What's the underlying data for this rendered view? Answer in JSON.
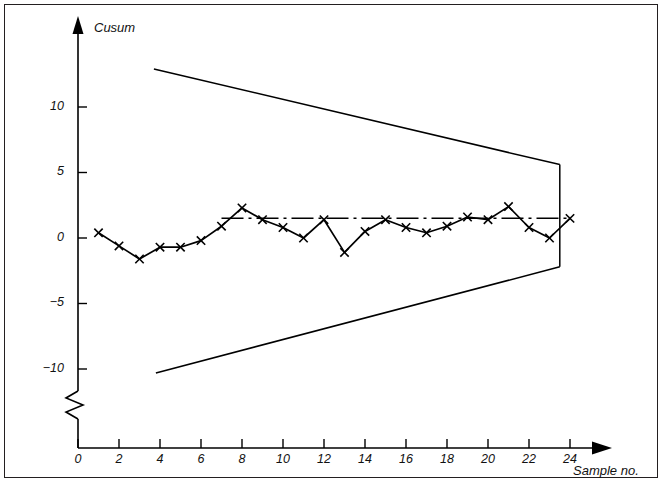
{
  "figure": {
    "border_color": "#231f20",
    "background": "#ffffff",
    "line_color": "#000000"
  },
  "axes": {
    "y_axis_title": "Cusum",
    "x_axis_title": "Sample no."
  },
  "chart_data": {
    "type": "line",
    "title": "",
    "subtitle": "",
    "xlabel": "Sample no.",
    "ylabel": "Cusum",
    "xlim": [
      0,
      26
    ],
    "ylim": [
      -12,
      14
    ],
    "grid": false,
    "legend": "none",
    "x_ticks": [
      0,
      2,
      4,
      6,
      8,
      10,
      12,
      14,
      16,
      18,
      20,
      22,
      24
    ],
    "x_tick_labels": [
      "0",
      "2",
      "4",
      "6",
      "8",
      "10",
      "12",
      "14",
      "16",
      "18",
      "20",
      "22",
      "24"
    ],
    "y_ticks": [
      10,
      5,
      0,
      -5,
      -10
    ],
    "y_tick_labels": [
      "10",
      "5",
      "0",
      "−5",
      "−10"
    ],
    "y_axis_break": true,
    "x": [
      1,
      2,
      3,
      4,
      5,
      6,
      7,
      8,
      9,
      10,
      11,
      12,
      13,
      14,
      15,
      16,
      17,
      18,
      19,
      20,
      21,
      22,
      23,
      24
    ],
    "values": [
      0.4,
      -0.6,
      -1.6,
      -0.7,
      -0.7,
      -0.2,
      0.9,
      2.3,
      1.4,
      0.8,
      0.0,
      1.4,
      -1.1,
      0.5,
      1.4,
      0.8,
      0.4,
      0.9,
      1.6,
      1.4,
      2.4,
      0.8,
      0.0,
      1.5
    ],
    "marker": "x",
    "series": [
      {
        "name": "cusum",
        "values": [
          0.4,
          -0.6,
          -1.6,
          -0.7,
          -0.7,
          -0.2,
          0.9,
          2.3,
          1.4,
          0.8,
          0.0,
          1.4,
          -1.1,
          0.5,
          1.4,
          0.8,
          0.4,
          0.9,
          1.6,
          1.4,
          2.4,
          0.8,
          0.0,
          1.5
        ]
      }
    ],
    "annotations": [
      {
        "name": "v-mask-upper-limit",
        "type": "line",
        "style": "solid",
        "points": [
          [
            3.7,
            12.9
          ],
          [
            23.5,
            5.6
          ]
        ]
      },
      {
        "name": "v-mask-lower-limit",
        "type": "line",
        "style": "solid",
        "points": [
          [
            3.8,
            -10.3
          ],
          [
            23.5,
            -2.2
          ]
        ]
      },
      {
        "name": "v-mask-vertex-line",
        "type": "line",
        "style": "solid",
        "points": [
          [
            23.5,
            5.6
          ],
          [
            23.5,
            -2.2
          ]
        ]
      },
      {
        "name": "target-reference-line",
        "type": "line",
        "style": "dash-dot",
        "points": [
          [
            7.0,
            1.5
          ],
          [
            24.0,
            1.5
          ]
        ]
      }
    ]
  }
}
